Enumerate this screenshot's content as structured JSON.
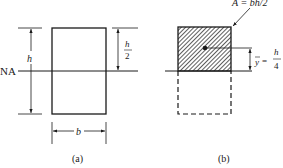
{
  "figure_a": {
    "caption": "(a)",
    "neutral_axis_label": "NA",
    "height_label": "h",
    "half_height_num": "h",
    "half_height_den": "2",
    "width_label": "b"
  },
  "figure_b": {
    "caption": "(b)",
    "area_label": "A = bh/2",
    "centroid_symbol": "y",
    "centroid_eq": "=",
    "centroid_num": "h",
    "centroid_den": "4"
  },
  "colors": {
    "stroke": "#1a1a1a",
    "background": "#ffffff"
  }
}
